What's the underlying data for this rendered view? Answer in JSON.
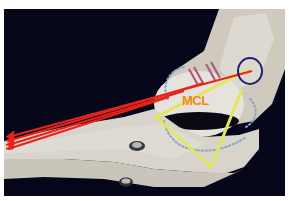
{
  "figure": {
    "labels": {
      "mcl": "MCL"
    },
    "colors": {
      "background": "#05061a",
      "bone": "#dcd8cf",
      "force_arrows": "#e8231b",
      "mcl_triangle": "#e4e65a",
      "circle": "#20206e",
      "dotted_outline": "#8fa3c8",
      "bars": "#b05a7a",
      "mcl_text": "#f08a1a"
    },
    "annotations": {
      "arrow_count": 4,
      "screws": 2
    }
  }
}
